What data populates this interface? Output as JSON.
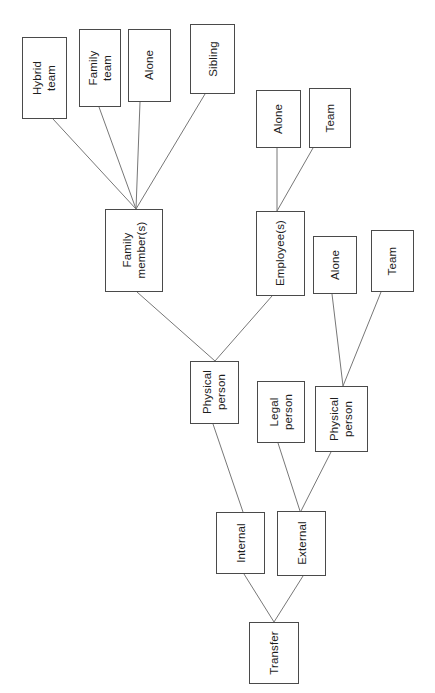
{
  "diagram": {
    "orientation": "rotated-90-ccw",
    "background_color": "#ffffff",
    "box_border_color": "#4a4a4a",
    "edge_color": "#777777",
    "text_color": "#1d1d1d",
    "canvas": {
      "width": 435,
      "height": 693
    },
    "caption": "",
    "nodes": [
      {
        "id": "hybrid-team",
        "label_line1": "Hybrid",
        "label_line2": "team",
        "x": 22,
        "y": 37,
        "w": 45,
        "h": 82
      },
      {
        "id": "family-team",
        "label_line1": "Family",
        "label_line2": "team",
        "x": 79,
        "y": 29,
        "w": 42,
        "h": 78
      },
      {
        "id": "alone-family",
        "label_line1": "Alone",
        "label_line2": "",
        "x": 128,
        "y": 29,
        "w": 43,
        "h": 73
      },
      {
        "id": "sibling",
        "label_line1": "Sibling",
        "label_line2": "",
        "x": 190,
        "y": 24,
        "w": 45,
        "h": 70
      },
      {
        "id": "family-members",
        "label_line1": "Family",
        "label_line2": "member(s)",
        "x": 105,
        "y": 209,
        "w": 58,
        "h": 83
      },
      {
        "id": "alone-employee",
        "label_line1": "Alone",
        "label_line2": "",
        "x": 256,
        "y": 90,
        "w": 45,
        "h": 58
      },
      {
        "id": "team-employee",
        "label_line1": "Team",
        "label_line2": "",
        "x": 309,
        "y": 88,
        "w": 42,
        "h": 60
      },
      {
        "id": "employees",
        "label_line1": "Employee(s)",
        "label_line2": "",
        "x": 256,
        "y": 211,
        "w": 49,
        "h": 85
      },
      {
        "id": "alone-physical",
        "label_line1": "Alone",
        "label_line2": "",
        "x": 313,
        "y": 236,
        "w": 44,
        "h": 58
      },
      {
        "id": "team-physical",
        "label_line1": "Team",
        "label_line2": "",
        "x": 371,
        "y": 230,
        "w": 43,
        "h": 62
      },
      {
        "id": "physical-person-c",
        "label_line1": "Physical",
        "label_line2": "person",
        "x": 190,
        "y": 361,
        "w": 49,
        "h": 63
      },
      {
        "id": "legal-person",
        "label_line1": "Legal",
        "label_line2": "person",
        "x": 257,
        "y": 381,
        "w": 48,
        "h": 62
      },
      {
        "id": "physical-person-r",
        "label_line1": "Physical",
        "label_line2": "person",
        "x": 315,
        "y": 386,
        "w": 53,
        "h": 66
      },
      {
        "id": "internal",
        "label_line1": "Internal",
        "label_line2": "",
        "x": 216,
        "y": 512,
        "w": 49,
        "h": 62
      },
      {
        "id": "external",
        "label_line1": "External",
        "label_line2": "",
        "x": 277,
        "y": 511,
        "w": 49,
        "h": 65
      },
      {
        "id": "transfer",
        "label_line1": "Transfer",
        "label_line2": "",
        "x": 249,
        "y": 622,
        "w": 50,
        "h": 62
      }
    ],
    "edges": [
      {
        "from": "hybrid-team",
        "to": "family-members",
        "x1": 53,
        "y1": 119,
        "x2": 136,
        "y2": 209
      },
      {
        "from": "family-team",
        "to": "family-members",
        "x1": 99,
        "y1": 107,
        "x2": 136,
        "y2": 209
      },
      {
        "from": "alone-family",
        "to": "family-members",
        "x1": 140,
        "y1": 102,
        "x2": 136,
        "y2": 209
      },
      {
        "from": "sibling",
        "to": "family-members",
        "x1": 205,
        "y1": 94,
        "x2": 136,
        "y2": 209
      },
      {
        "from": "alone-employee",
        "to": "employees",
        "x1": 277,
        "y1": 148,
        "x2": 277,
        "y2": 211
      },
      {
        "from": "team-employee",
        "to": "employees",
        "x1": 313,
        "y1": 148,
        "x2": 277,
        "y2": 211
      },
      {
        "from": "family-members",
        "to": "physical-person-c",
        "x1": 137,
        "y1": 292,
        "x2": 215,
        "y2": 361
      },
      {
        "from": "employees",
        "to": "physical-person-c",
        "x1": 272,
        "y1": 296,
        "x2": 215,
        "y2": 361
      },
      {
        "from": "alone-physical",
        "to": "physical-person-r",
        "x1": 332,
        "y1": 294,
        "x2": 343,
        "y2": 386
      },
      {
        "from": "team-physical",
        "to": "physical-person-r",
        "x1": 381,
        "y1": 292,
        "x2": 343,
        "y2": 386
      },
      {
        "from": "physical-person-c",
        "to": "internal",
        "x1": 213,
        "y1": 424,
        "x2": 243,
        "y2": 512
      },
      {
        "from": "legal-person",
        "to": "external",
        "x1": 278,
        "y1": 443,
        "x2": 300,
        "y2": 511
      },
      {
        "from": "physical-person-r",
        "to": "external",
        "x1": 331,
        "y1": 452,
        "x2": 301,
        "y2": 511
      },
      {
        "from": "internal",
        "to": "transfer",
        "x1": 244,
        "y1": 574,
        "x2": 274,
        "y2": 622
      },
      {
        "from": "external",
        "to": "transfer",
        "x1": 303,
        "y1": 576,
        "x2": 274,
        "y2": 622
      }
    ]
  }
}
